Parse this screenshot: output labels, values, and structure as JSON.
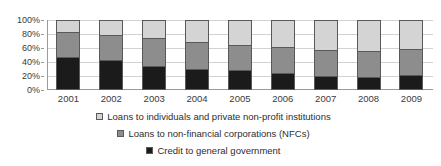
{
  "chart_data": {
    "type": "bar",
    "subtype": "stacked-100-percent",
    "title": "",
    "xlabel": "",
    "ylabel": "",
    "categories": [
      "2001",
      "2002",
      "2003",
      "2004",
      "2005",
      "2006",
      "2007",
      "2008",
      "2009"
    ],
    "ylim": [
      0,
      100
    ],
    "ytick_labels": [
      "0%",
      "20%",
      "40%",
      "60%",
      "80%",
      "100%"
    ],
    "ytick_values": [
      0,
      20,
      40,
      60,
      80,
      100
    ],
    "grid": true,
    "legend_position": "bottom",
    "series": [
      {
        "name": "Credit to general government",
        "color": "#1b1b1b",
        "values": [
          47,
          43,
          35,
          30,
          29,
          24,
          20,
          18,
          21
        ]
      },
      {
        "name": "Loans to non-financial corporations (NFCs)",
        "color": "#8d8d8d",
        "values": [
          36,
          36,
          39,
          38,
          35,
          37,
          37,
          38,
          37
        ]
      },
      {
        "name": "Loans to individuals and private non-profit institutions",
        "color": "#d4d4d4",
        "values": [
          17,
          21,
          26,
          32,
          36,
          39,
          43,
          44,
          42
        ]
      }
    ],
    "legend_order": [
      "Loans to individuals and private non-profit institutions",
      "Loans to non-financial corporations (NFCs)",
      "Credit to general government"
    ]
  },
  "legend": {
    "entries": [
      {
        "label": "Loans to individuals and private non-profit institutions",
        "swatch_color": "#d4d4d4"
      },
      {
        "label": "Loans to non-financial corporations (NFCs)",
        "swatch_color": "#8d8d8d"
      },
      {
        "label": "Credit to general government",
        "swatch_color": "#1b1b1b"
      }
    ]
  }
}
